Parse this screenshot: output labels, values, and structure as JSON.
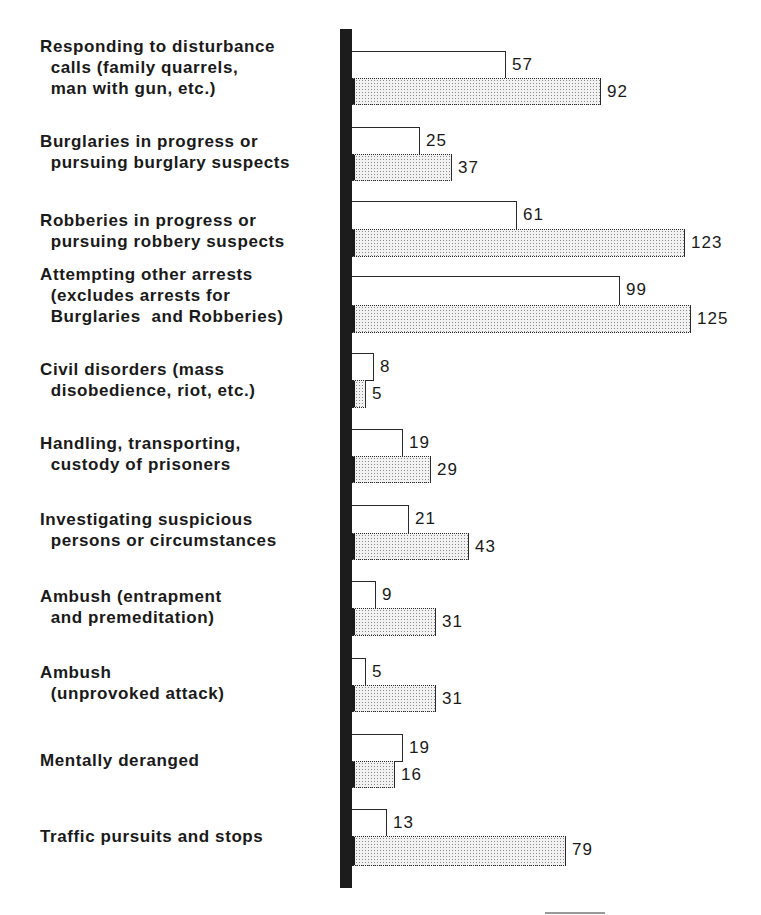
{
  "chart_data": {
    "type": "bar",
    "orientation": "horizontal",
    "title": "",
    "xlabel": "",
    "ylabel": "",
    "grid": false,
    "legend": null,
    "categories": [
      "Responding to disturbance calls (family quarrels, man with gun, etc.)",
      "Burglaries in progress or pursuing burglary suspects",
      "Robberies in progress or pursuing robbery suspects",
      "Attempting other arrests (excludes arrests for Burglaries and Robberies)",
      "Civil disorders (mass disobedience, riot, etc.)",
      "Handling, transporting, custody of prisoners",
      "Investigating suspicious persons or circumstances",
      "Ambush (entrapment and premeditation)",
      "Ambush (unprovoked attack)",
      "Mentally deranged",
      "Traffic pursuits and stops"
    ],
    "series": [
      {
        "name": "white bars",
        "fill": "#ffffff",
        "values": [
          57,
          25,
          61,
          99,
          8,
          19,
          21,
          9,
          5,
          19,
          13
        ]
      },
      {
        "name": "dotted bars",
        "fill": "#e6e6e6",
        "values": [
          92,
          37,
          123,
          125,
          5,
          29,
          43,
          31,
          31,
          16,
          79
        ]
      }
    ]
  },
  "labels": [
    {
      "text": "Responding to disturbance\n  calls (family quarrels,\n  man with gun, etc.)",
      "top": 36
    },
    {
      "text": "Burglaries in progress or\n  pursuing burglary suspects",
      "top": 131
    },
    {
      "text": "Robberies in progress or\n  pursuing robbery suspects",
      "top": 210
    },
    {
      "text": "Attempting other arrests\n  (excludes arrests for\n  Burglaries  and Robberies)",
      "top": 264
    },
    {
      "text": "Civil disorders (mass\n  disobedience, riot, etc.)",
      "top": 359
    },
    {
      "text": "Handling, transporting,\n  custody of prisoners",
      "top": 433
    },
    {
      "text": "Investigating suspicious\n  persons or circumstances",
      "top": 509
    },
    {
      "text": "Ambush (entrapment\n  and premeditation)",
      "top": 586
    },
    {
      "text": "Ambush\n  (unprovoked attack)",
      "top": 662
    },
    {
      "text": "Mentally deranged",
      "top": 750
    },
    {
      "text": "Traffic pursuits and stops",
      "top": 826
    }
  ],
  "value_labels": {
    "white": [
      "57",
      "25",
      "61",
      "99",
      "8",
      "19",
      "21",
      "9",
      "5",
      "19",
      "13"
    ],
    "dotted": [
      "92",
      "37",
      "123",
      "125",
      "5",
      "29",
      "43",
      "31",
      "31",
      "16",
      "79"
    ]
  }
}
